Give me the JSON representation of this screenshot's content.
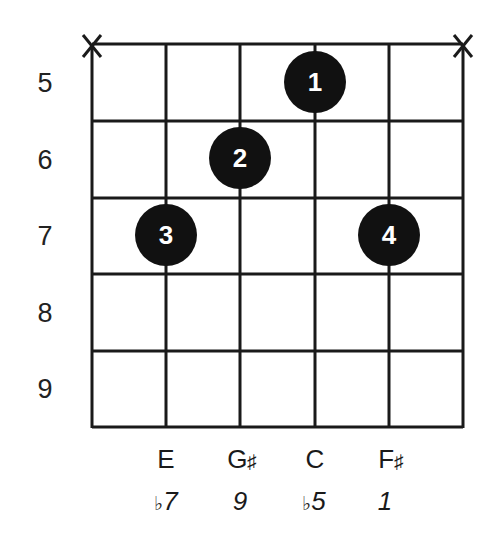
{
  "diagram": {
    "type": "guitar-chord-diagram",
    "colors": {
      "line": "#1a1a1a",
      "dot": "#111111",
      "dot_text": "#ffffff",
      "background": "#ffffff"
    },
    "muted_strings": [
      1,
      6
    ],
    "muted_symbol": "X",
    "fret_numbers": [
      "5",
      "6",
      "7",
      "8",
      "9"
    ],
    "dots": [
      {
        "finger": "1",
        "string": 4,
        "fret": 5
      },
      {
        "finger": "2",
        "string": 3,
        "fret": 6
      },
      {
        "finger": "3",
        "string": 2,
        "fret": 7
      },
      {
        "finger": "4",
        "string": 5,
        "fret": 7
      }
    ],
    "notes": [
      {
        "string": 2,
        "note": "E",
        "accidental": ""
      },
      {
        "string": 3,
        "note": "G",
        "accidental": "♯"
      },
      {
        "string": 4,
        "note": "C",
        "accidental": ""
      },
      {
        "string": 5,
        "note": "F",
        "accidental": "♯"
      }
    ],
    "intervals": [
      {
        "string": 2,
        "flat": "♭",
        "degree": "7"
      },
      {
        "string": 3,
        "flat": "",
        "degree": "9"
      },
      {
        "string": 4,
        "flat": "♭",
        "degree": "5"
      },
      {
        "string": 5,
        "flat": "",
        "degree": "1"
      }
    ]
  }
}
